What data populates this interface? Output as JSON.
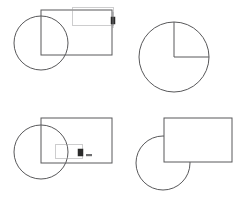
{
  "figure": {
    "title": "",
    "background_color": "#ffffff",
    "stroke_color": "#58585a",
    "marquee_color": "#9a9a9c",
    "handle_color": "#2b2b2b",
    "width": 246,
    "height": 209
  },
  "panels": [
    {
      "id": "panel-top-left",
      "name": "crossing-selection-before",
      "label": "",
      "circle": {
        "cx": 41,
        "cy": 43,
        "r": 27,
        "clipped": false
      },
      "rectangle": {
        "x": 41,
        "y": 10,
        "w": 71,
        "h": 45
      },
      "marquee": {
        "x": 72,
        "y": 7,
        "w": 41,
        "h": 18,
        "style": "dotted"
      },
      "handle": {
        "x": 113,
        "y": 19,
        "size": 4,
        "label": ""
      }
    },
    {
      "id": "panel-top-right",
      "name": "quarter-sector-result",
      "label": "",
      "circle": {
        "cx": 174,
        "cy": 57,
        "r": 35,
        "clipped": false
      },
      "radii": [
        {
          "angle_deg": 90,
          "from": "center",
          "to": "top"
        },
        {
          "angle_deg": 0,
          "from": "center",
          "to": "right"
        }
      ]
    },
    {
      "id": "panel-bottom-left",
      "name": "window-selection-before",
      "label": "",
      "circle": {
        "cx": 41,
        "cy": 152,
        "r": 27,
        "clipped": false
      },
      "rectangle": {
        "x": 41,
        "y": 118,
        "w": 71,
        "h": 45
      },
      "marquee": {
        "x": 55,
        "y": 144,
        "w": 27,
        "h": 14,
        "style": "dotted"
      },
      "handle": {
        "x": 80,
        "y": 151,
        "size": 4,
        "label": ""
      }
    },
    {
      "id": "panel-bottom-right",
      "name": "trimmed-circle-result",
      "label": "",
      "circle": {
        "cx": 163,
        "cy": 163,
        "r": 27,
        "clipped": true
      },
      "rectangle": {
        "x": 164,
        "y": 118,
        "w": 68,
        "h": 44
      }
    }
  ],
  "annotations": {
    "top_left_handle_note": "",
    "bottom_left_handle_note": ""
  }
}
